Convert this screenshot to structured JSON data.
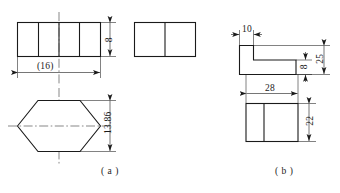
{
  "figure": {
    "background_color": "#ffffff",
    "line_color": "#1a1a1a",
    "dimension_color": "#1a1a1a",
    "centerline_color": "#555555"
  },
  "part_a": {
    "caption": "( a )",
    "front_view": {
      "name": "prism-front-view",
      "divider_count": 3,
      "dimensions": {
        "width_label": "(16)",
        "height_label": "8"
      }
    },
    "side_view": {
      "name": "prism-side-view",
      "divider_count": 1
    },
    "top_view": {
      "name": "hexagon-top-view",
      "shape": "hexagon",
      "dimensions": {
        "across_flats_label": "13.86"
      }
    }
  },
  "part_b": {
    "caption": "( b )",
    "front_view": {
      "name": "lbracket-front-view",
      "shape": "L-shape",
      "dimensions": {
        "step_width_label": "10",
        "base_thickness_label": "8",
        "total_height_label": "25",
        "total_width_label": "28"
      }
    },
    "top_view": {
      "name": "lbracket-top-view",
      "divider_count": 1,
      "dimensions": {
        "depth_label": "22"
      }
    }
  },
  "dimension_values": {
    "a_width": "(16)",
    "a_height": "8",
    "a_across_flats": "13.86",
    "b_step": "10",
    "b_thickness": "8",
    "b_height": "25",
    "b_width": "28",
    "b_depth": "22"
  }
}
